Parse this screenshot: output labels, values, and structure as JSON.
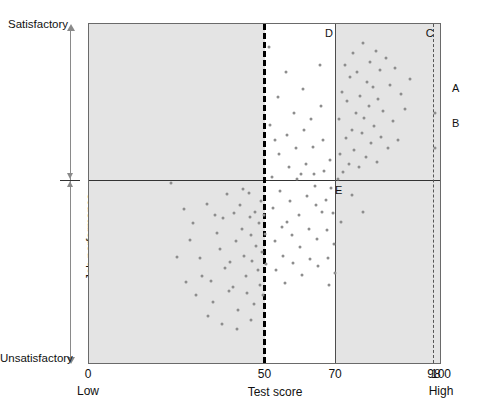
{
  "chart_data": {
    "type": "scatter",
    "title": "",
    "xlabel": "Test score",
    "ylabel": "Job performance",
    "xlim": [
      0,
      100
    ],
    "ylim": [
      0,
      100
    ],
    "grid": false,
    "legend": "none",
    "x_ticks": [
      {
        "value": 0,
        "label": "0"
      },
      {
        "value": 50,
        "label": "50"
      },
      {
        "value": 70,
        "label": "70"
      },
      {
        "value": 98,
        "label": "98"
      },
      {
        "value": 100,
        "label": "100"
      }
    ],
    "x_sublabels": [
      {
        "value": 0,
        "label": "Low"
      },
      {
        "value": 100,
        "label": "High"
      }
    ],
    "y_axis_labels": {
      "top": "Satisfactory",
      "bottom": "Unsatisfactory"
    },
    "reference_lines": [
      {
        "name": "test-cutoff-50",
        "axis": "x",
        "value": 50,
        "style": "dashed",
        "weight": "thick"
      },
      {
        "name": "test-cutoff-70",
        "axis": "x",
        "value": 70,
        "style": "solid",
        "weight": "thin"
      },
      {
        "name": "test-cutoff-98",
        "axis": "x",
        "value": 98,
        "style": "dashed",
        "weight": "thin"
      },
      {
        "name": "performance-cutoff",
        "axis": "y",
        "value": 53.95,
        "style": "solid",
        "weight": "thin"
      }
    ],
    "shaded_bands": [
      {
        "name": "band-below-50",
        "from": 0,
        "to": 50,
        "color": "#e4e4e4"
      },
      {
        "name": "band-above-70",
        "from": 70,
        "to": 100,
        "color": "#e4e4e4"
      }
    ],
    "region_labels": [
      {
        "id": "A",
        "label": "A",
        "x": 101.5,
        "y": 74.0
      },
      {
        "id": "B",
        "label": "B",
        "x": 101.5,
        "y": 63.5
      },
      {
        "id": "C",
        "label": "C",
        "x": 96.5,
        "y": 97.0
      },
      {
        "id": "D",
        "label": "D",
        "x": 68.0,
        "y": 97.0
      },
      {
        "id": "E",
        "label": "E",
        "x": 70.8,
        "y": 51.0
      }
    ],
    "point_color": "#8d8d8d",
    "point_count": 148,
    "points": [
      [
        23.2,
        53.3
      ],
      [
        26.9,
        45.8
      ],
      [
        28.5,
        36.7
      ],
      [
        29.6,
        41.6
      ],
      [
        31.4,
        31.5
      ],
      [
        32.0,
        26.0
      ],
      [
        33.4,
        47.2
      ],
      [
        34.5,
        24.5
      ],
      [
        35.0,
        18.5
      ],
      [
        36.2,
        38.6
      ],
      [
        37.1,
        34.0
      ],
      [
        38.0,
        43.0
      ],
      [
        38.4,
        28.5
      ],
      [
        39.2,
        50.1
      ],
      [
        40.0,
        30.2
      ],
      [
        40.8,
        23.0
      ],
      [
        41.0,
        44.5
      ],
      [
        41.7,
        36.5
      ],
      [
        42.2,
        16.2
      ],
      [
        42.8,
        47.0
      ],
      [
        43.3,
        40.0
      ],
      [
        43.9,
        32.0
      ],
      [
        44.5,
        26.2
      ],
      [
        44.8,
        21.0
      ],
      [
        45.2,
        50.3
      ],
      [
        45.6,
        43.3
      ],
      [
        46.0,
        38.0
      ],
      [
        46.3,
        30.5
      ],
      [
        46.7,
        18.0
      ],
      [
        47.0,
        45.0
      ],
      [
        47.4,
        35.0
      ],
      [
        47.8,
        28.0
      ],
      [
        48.1,
        41.7
      ],
      [
        48.4,
        23.6
      ],
      [
        48.7,
        48.0
      ],
      [
        49.0,
        33.0
      ],
      [
        49.3,
        20.4
      ],
      [
        49.6,
        44.0
      ],
      [
        49.9,
        38.5
      ],
      [
        50.1,
        29.5
      ],
      [
        24.8,
        31.8
      ],
      [
        27.5,
        24.2
      ],
      [
        30.2,
        20.5
      ],
      [
        33.8,
        14.5
      ],
      [
        35.8,
        43.9
      ],
      [
        37.8,
        12.0
      ],
      [
        39.8,
        21.7
      ],
      [
        41.9,
        10.5
      ],
      [
        43.5,
        51.5
      ],
      [
        45.8,
        13.2
      ],
      [
        51.0,
        93.2
      ],
      [
        51.4,
        70.5
      ],
      [
        51.8,
        55.0
      ],
      [
        52.2,
        46.0
      ],
      [
        52.6,
        36.5
      ],
      [
        53.0,
        28.0
      ],
      [
        53.4,
        78.5
      ],
      [
        53.8,
        62.0
      ],
      [
        54.2,
        51.0
      ],
      [
        54.6,
        40.5
      ],
      [
        55.0,
        32.0
      ],
      [
        55.4,
        24.0
      ],
      [
        55.8,
        86.0
      ],
      [
        56.2,
        67.5
      ],
      [
        56.6,
        58.0
      ],
      [
        57.0,
        48.0
      ],
      [
        57.4,
        38.0
      ],
      [
        57.8,
        30.0
      ],
      [
        58.2,
        74.0
      ],
      [
        58.6,
        63.5
      ],
      [
        59.0,
        54.5
      ],
      [
        59.4,
        44.0
      ],
      [
        59.8,
        34.5
      ],
      [
        60.2,
        26.5
      ],
      [
        60.6,
        81.0
      ],
      [
        61.0,
        69.0
      ],
      [
        61.4,
        59.0
      ],
      [
        61.8,
        49.5
      ],
      [
        62.2,
        40.0
      ],
      [
        62.6,
        31.0
      ],
      [
        63.0,
        72.0
      ],
      [
        63.4,
        64.0
      ],
      [
        63.8,
        56.0
      ],
      [
        64.2,
        47.0
      ],
      [
        64.6,
        37.0
      ],
      [
        65.0,
        29.0
      ],
      [
        65.4,
        88.0
      ],
      [
        65.8,
        76.0
      ],
      [
        66.2,
        66.0
      ],
      [
        66.6,
        57.0
      ],
      [
        67.0,
        48.5
      ],
      [
        67.4,
        39.5
      ],
      [
        67.8,
        31.5
      ],
      [
        68.2,
        60.0
      ],
      [
        68.6,
        52.0
      ],
      [
        69.0,
        44.5
      ],
      [
        69.4,
        35.5
      ],
      [
        69.8,
        27.0
      ],
      [
        52.8,
        66.0
      ],
      [
        56.0,
        42.0
      ],
      [
        60.0,
        56.0
      ],
      [
        64.0,
        52.5
      ],
      [
        66.0,
        45.0
      ],
      [
        68.0,
        23.5
      ],
      [
        70.4,
        54.5
      ],
      [
        70.8,
        72.0
      ],
      [
        71.2,
        62.0
      ],
      [
        71.6,
        80.0
      ],
      [
        72.0,
        56.5
      ],
      [
        72.4,
        88.0
      ],
      [
        72.8,
        66.5
      ],
      [
        73.2,
        77.5
      ],
      [
        73.6,
        59.0
      ],
      [
        74.0,
        84.5
      ],
      [
        74.4,
        69.0
      ],
      [
        74.8,
        91.5
      ],
      [
        75.2,
        63.0
      ],
      [
        75.6,
        74.0
      ],
      [
        76.0,
        86.0
      ],
      [
        76.4,
        58.0
      ],
      [
        76.8,
        79.0
      ],
      [
        77.2,
        68.0
      ],
      [
        77.6,
        94.5
      ],
      [
        78.0,
        72.5
      ],
      [
        78.4,
        61.0
      ],
      [
        78.8,
        83.0
      ],
      [
        79.2,
        76.0
      ],
      [
        79.6,
        89.0
      ],
      [
        80.0,
        65.0
      ],
      [
        80.4,
        81.5
      ],
      [
        80.8,
        70.0
      ],
      [
        81.2,
        92.0
      ],
      [
        81.6,
        59.5
      ],
      [
        82.0,
        78.0
      ],
      [
        82.4,
        86.5
      ],
      [
        82.8,
        67.0
      ],
      [
        83.4,
        74.5
      ],
      [
        84.0,
        90.0
      ],
      [
        84.6,
        63.5
      ],
      [
        85.2,
        82.0
      ],
      [
        86.0,
        71.5
      ],
      [
        86.8,
        87.0
      ],
      [
        87.6,
        66.0
      ],
      [
        88.4,
        79.5
      ],
      [
        89.5,
        75.0
      ],
      [
        91.0,
        84.0
      ],
      [
        74.5,
        50.0
      ],
      [
        77.5,
        45.0
      ],
      [
        71.5,
        42.0
      ],
      [
        98.0,
        74.0
      ],
      [
        98.0,
        63.5
      ]
    ]
  }
}
